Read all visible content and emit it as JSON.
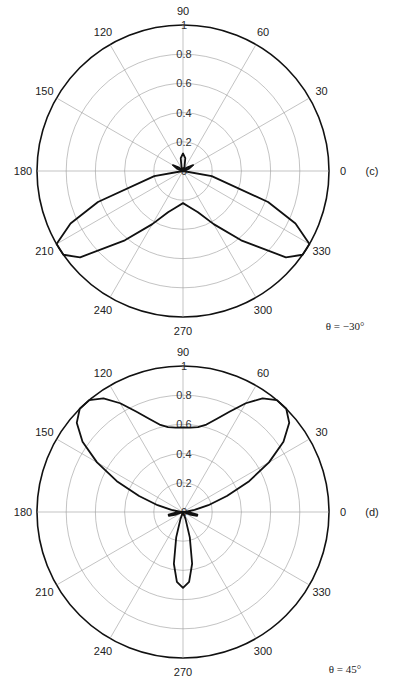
{
  "figure": {
    "charts": [
      {
        "id": "c",
        "panel_label": "(c)",
        "caption": "θ = −30°"
      },
      {
        "id": "d",
        "panel_label": "(d)",
        "caption": "θ = 45°"
      }
    ]
  },
  "chart_data": [
    {
      "type": "line",
      "subtype": "polar",
      "title": "",
      "panel_label": "(c)",
      "annotation": "θ = −30°",
      "angular_ticks": [
        0,
        30,
        60,
        90,
        120,
        150,
        180,
        210,
        240,
        270,
        300,
        330
      ],
      "radial_ticks": [
        0,
        0.2,
        0.4,
        0.6,
        0.8,
        1
      ],
      "rlim": [
        0,
        1
      ],
      "grid": true,
      "legend": null,
      "series": [
        {
          "name": "pattern",
          "angle_deg": [
            0,
            10,
            20,
            30,
            40,
            50,
            60,
            70,
            80,
            90,
            100,
            110,
            120,
            130,
            140,
            150,
            160,
            170,
            180,
            190,
            200,
            205,
            210,
            215,
            220,
            230,
            240,
            250,
            260,
            270,
            280,
            290,
            300,
            310,
            320,
            325,
            330,
            335,
            340,
            350,
            360
          ],
          "r": [
            0.0,
            0.0,
            0.04,
            0.08,
            0.04,
            0.0,
            0.0,
            0.03,
            0.09,
            0.12,
            0.09,
            0.03,
            0.0,
            0.0,
            0.04,
            0.08,
            0.04,
            0.0,
            0.0,
            0.2,
            0.62,
            0.85,
            1.0,
            1.0,
            0.92,
            0.62,
            0.42,
            0.3,
            0.25,
            0.22,
            0.25,
            0.3,
            0.42,
            0.62,
            0.92,
            1.0,
            1.0,
            0.85,
            0.62,
            0.2,
            0.0
          ]
        }
      ]
    },
    {
      "type": "line",
      "subtype": "polar",
      "title": "",
      "panel_label": "(d)",
      "annotation": "θ = 45°",
      "angular_ticks": [
        0,
        30,
        60,
        90,
        120,
        150,
        180,
        210,
        240,
        270,
        300,
        330
      ],
      "radial_ticks": [
        0,
        0.2,
        0.4,
        0.6,
        0.8,
        1
      ],
      "rlim": [
        0,
        1
      ],
      "grid": true,
      "legend": null,
      "series": [
        {
          "name": "pattern",
          "angle_deg": [
            0,
            5,
            10,
            15,
            20,
            25,
            30,
            35,
            40,
            45,
            50,
            55,
            60,
            65,
            70,
            75,
            80,
            85,
            90,
            95,
            100,
            105,
            110,
            115,
            120,
            125,
            130,
            135,
            140,
            145,
            150,
            155,
            160,
            165,
            170,
            175,
            180,
            185,
            190,
            195,
            200,
            205,
            210,
            220,
            230,
            240,
            250,
            255,
            260,
            265,
            270,
            275,
            280,
            285,
            290,
            300,
            310,
            320,
            330,
            335,
            340,
            345,
            350,
            355,
            360
          ],
          "r": [
            0.0,
            0.02,
            0.08,
            0.18,
            0.32,
            0.5,
            0.68,
            0.84,
            0.95,
            1.0,
            1.0,
            0.95,
            0.86,
            0.76,
            0.68,
            0.62,
            0.59,
            0.58,
            0.58,
            0.58,
            0.59,
            0.62,
            0.68,
            0.76,
            0.86,
            0.95,
            1.0,
            1.0,
            0.95,
            0.84,
            0.68,
            0.5,
            0.32,
            0.18,
            0.08,
            0.02,
            0.0,
            0.05,
            0.1,
            0.1,
            0.05,
            0.0,
            0.0,
            0.0,
            0.0,
            0.0,
            0.05,
            0.18,
            0.36,
            0.48,
            0.52,
            0.48,
            0.36,
            0.18,
            0.05,
            0.0,
            0.0,
            0.0,
            0.0,
            0.0,
            0.05,
            0.1,
            0.1,
            0.05,
            0.0
          ]
        }
      ]
    }
  ]
}
